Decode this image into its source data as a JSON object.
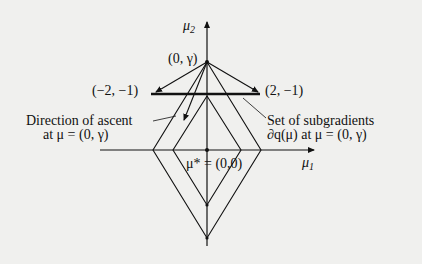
{
  "diagram": {
    "axes": {
      "x_label": "μ",
      "x_sub": "1",
      "y_label": "μ",
      "y_sub": "2"
    },
    "points": {
      "top": "(0, γ)",
      "left": "(−2, −1)",
      "right": "(2, −1)",
      "origin": "μ* = (0,0)"
    },
    "annotations": {
      "ascent_line1": "Direction of ascent",
      "ascent_line2": "at μ = (0, γ)",
      "subgrad_line1": "Set of subgradients",
      "subgrad_line2": "∂q(μ) at μ = (0, γ)"
    },
    "colors": {
      "background": "#f0f0ee",
      "ink": "#111111"
    }
  }
}
